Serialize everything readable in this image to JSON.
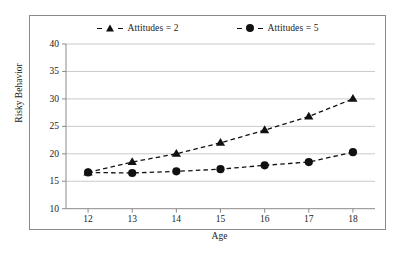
{
  "chart_data": {
    "type": "line",
    "title": "",
    "xlabel": "Age",
    "ylabel": "Risky Behavior",
    "x": [
      12,
      13,
      14,
      15,
      16,
      17,
      18
    ],
    "xtick_labels": [
      "12",
      "13",
      "14",
      "15",
      "16",
      "17",
      "18"
    ],
    "ytick_labels": [
      "10",
      "15",
      "20",
      "25",
      "30",
      "35",
      "40"
    ],
    "yticks": [
      10,
      15,
      20,
      25,
      30,
      35,
      40
    ],
    "xlim": [
      11.5,
      18.5
    ],
    "ylim": [
      10,
      40
    ],
    "grid": "horizontal",
    "legend_position": "top-center",
    "series": [
      {
        "name": "Attitudes = 2",
        "marker": "triangle",
        "linestyle": "dashed",
        "color": "#111111",
        "values": [
          16.6,
          18.5,
          20.0,
          22.0,
          24.3,
          26.8,
          30.0
        ]
      },
      {
        "name": "Attitudes = 5",
        "marker": "circle",
        "linestyle": "dashed",
        "color": "#111111",
        "values": [
          16.6,
          16.5,
          16.8,
          17.2,
          17.9,
          18.5,
          20.3
        ]
      }
    ]
  },
  "legend": {
    "entries": [
      {
        "label": "Attitudes = 2",
        "marker": "triangle-marker"
      },
      {
        "label": "Attitudes = 5",
        "marker": "circle-marker"
      }
    ]
  },
  "axes": {
    "y_title": "Risky Behavior",
    "x_title": "Age"
  },
  "style": {
    "grid_color": "#bdbdbd",
    "axis_color": "#8a8a8a",
    "series_color": "#111111",
    "frame_color": "#8a8a8a",
    "background": "#ffffff"
  }
}
